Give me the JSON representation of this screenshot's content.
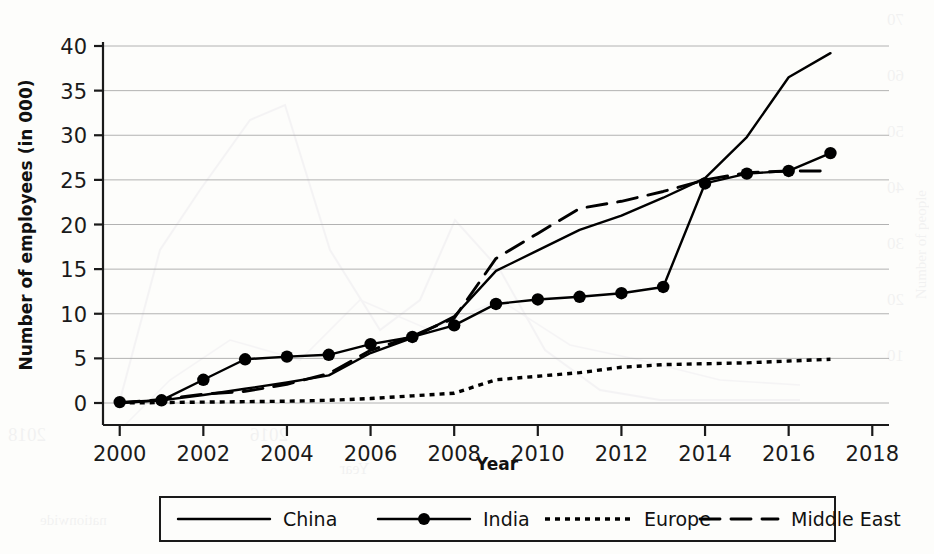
{
  "chart_data": {
    "type": "line",
    "title": "",
    "xlabel": "Year",
    "ylabel": "Number of employees (in 000)",
    "xlim": [
      1999.6,
      2018.4
    ],
    "ylim": [
      -1.5,
      41.5
    ],
    "xticks": [
      "2000",
      "2002",
      "2004",
      "2006",
      "2008",
      "2010",
      "2012",
      "2014",
      "2016",
      "2018"
    ],
    "xtick_values": [
      2000,
      2002,
      2004,
      2006,
      2008,
      2010,
      2012,
      2014,
      2016,
      2018
    ],
    "yticks": [
      "0",
      "5",
      "10",
      "15",
      "20",
      "25",
      "30",
      "35",
      "40"
    ],
    "ytick_values": [
      0,
      5,
      10,
      15,
      20,
      25,
      30,
      35,
      40
    ],
    "grid": "horizontal",
    "legend_position": "bottom",
    "x": [
      2000,
      2001,
      2002,
      2003,
      2004,
      2005,
      2006,
      2007,
      2008,
      2009,
      2010,
      2011,
      2012,
      2013,
      2014,
      2015,
      2016,
      2017
    ],
    "series": [
      {
        "name": "China",
        "style": "solid",
        "marker": "none",
        "values": [
          0.0,
          0.3,
          0.9,
          1.6,
          2.3,
          3.1,
          5.6,
          7.3,
          9.7,
          14.8,
          17.1,
          19.4,
          21.0,
          23.0,
          25.2,
          29.8,
          36.5,
          39.2
        ]
      },
      {
        "name": "India",
        "style": "solid",
        "marker": "circle",
        "values": [
          0.1,
          0.3,
          2.6,
          4.9,
          5.2,
          5.4,
          6.6,
          7.4,
          8.7,
          11.1,
          11.6,
          11.9,
          12.3,
          13.0,
          24.6,
          25.7,
          26.0,
          28.0
        ]
      },
      {
        "name": "Europe",
        "style": "dotted",
        "marker": "none",
        "values": [
          0.0,
          0.05,
          0.1,
          0.15,
          0.2,
          0.3,
          0.5,
          0.8,
          1.1,
          2.6,
          3.0,
          3.4,
          4.0,
          4.3,
          4.4,
          4.5,
          4.7,
          4.9
        ]
      },
      {
        "name": "Middle East",
        "style": "dashed",
        "marker": "none",
        "values": [
          0.0,
          0.4,
          1.0,
          1.3,
          2.1,
          3.3,
          5.9,
          7.5,
          9.5,
          16.2,
          19.0,
          21.8,
          22.6,
          23.7,
          25.0,
          25.8,
          26.0,
          26.0
        ]
      }
    ]
  },
  "legend": {
    "items": [
      {
        "label": "China"
      },
      {
        "label": "India"
      },
      {
        "label": "Europe"
      },
      {
        "label": "Middle East"
      }
    ]
  },
  "bleed_through": {
    "right_ticks": [
      "70",
      "60",
      "50",
      "40",
      "30",
      "20",
      "10",
      "0"
    ],
    "right_label": "Number of people",
    "bottom_left": "2018",
    "bottom_mid": "2016",
    "bottom_axis_label": "Year",
    "caption_fragment": "nationwide"
  }
}
